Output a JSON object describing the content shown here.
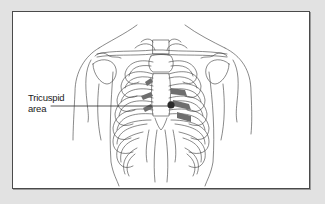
{
  "figure": {
    "labels": [
      {
        "id": "tricuspid",
        "lines": [
          "Tricuspid",
          "area"
        ],
        "marker": "filled-dot"
      }
    ]
  },
  "colors": {
    "page_background": "#e2e2e2",
    "frame_background": "#ffffff",
    "frame_border": "#4a4a4a",
    "line_art": "#3a3a3a",
    "shaded_areas": "#6e6e6e",
    "marker_dot": "#2a2a2a"
  }
}
